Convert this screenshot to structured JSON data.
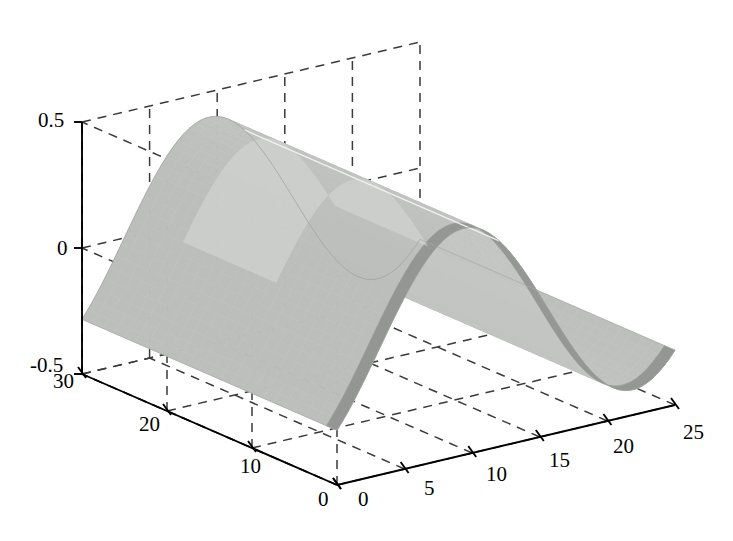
{
  "figure": {
    "background_color": "#ffffff",
    "width": 733,
    "height": 541,
    "title": "",
    "axis_line_color": "#000000",
    "grid_color": "#3a3a3a",
    "grid_style": "dashed"
  },
  "chart_data": {
    "type": "surface",
    "title": "",
    "xlabel": "",
    "ylabel": "",
    "zlabel": "",
    "xlim": [
      0,
      25
    ],
    "ylim": [
      0,
      30
    ],
    "zlim": [
      -0.5,
      0.5
    ],
    "x_ticks": [
      0,
      5,
      10,
      15,
      20,
      25
    ],
    "x_tick_labels": [
      "0",
      "5",
      "10",
      "15",
      "20",
      "25"
    ],
    "y_ticks": [
      0,
      10,
      20,
      30
    ],
    "y_tick_labels": [
      "0",
      "10",
      "20",
      "30"
    ],
    "z_ticks": [
      -0.5,
      0,
      0.5
    ],
    "z_tick_labels": [
      "-0.5",
      "0",
      "0.5"
    ],
    "grid": true,
    "legend": false,
    "view": {
      "azimuth": -37.5,
      "elevation": 30
    },
    "colormap": "gray",
    "surface_face_color": "#b9bbb9",
    "surface_highlight_color": "#d8dad8",
    "surface_shadow_color": "#8e908e",
    "z_amplitude": 0.4,
    "x_period": 25,
    "nx": 26,
    "ny": 31,
    "z_min_observed": -0.4,
    "z_max_observed": 0.4,
    "mesh_line_x": 12
  },
  "ticks": {
    "z": [
      {
        "label": "0.5",
        "left": 38,
        "top": 110
      },
      {
        "label": "0",
        "left": 57,
        "top": 238
      },
      {
        "label": "-0.5",
        "left": 30,
        "top": 355
      }
    ],
    "y": [
      {
        "label": "30",
        "left": 53,
        "top": 371
      },
      {
        "label": "20",
        "left": 139,
        "top": 414
      },
      {
        "label": "10",
        "left": 240,
        "top": 456
      },
      {
        "label": "0",
        "left": 318,
        "top": 489
      }
    ],
    "x": [
      {
        "label": "0",
        "left": 358,
        "top": 489
      },
      {
        "label": "5",
        "left": 424,
        "top": 478
      },
      {
        "label": "10",
        "left": 486,
        "top": 464
      },
      {
        "label": "15",
        "left": 549,
        "top": 450
      },
      {
        "label": "20",
        "left": 613,
        "top": 436
      },
      {
        "label": "25",
        "left": 683,
        "top": 422
      }
    ]
  }
}
